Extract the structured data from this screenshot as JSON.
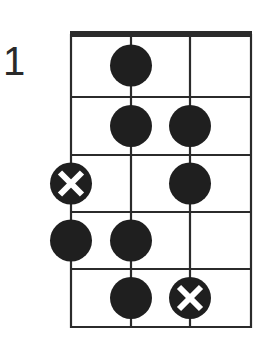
{
  "diagram": {
    "type": "fretboard-chord-diagram",
    "starting_fret_label": "1",
    "strings": 4,
    "frets_shown": 5,
    "colors": {
      "line": "#2b2b2b",
      "dot": "#1f1f1f",
      "x_mark": "#ffffff",
      "background": "#ffffff"
    },
    "markers": [
      {
        "fret": 1,
        "string": 2,
        "kind": "dot"
      },
      {
        "fret": 2,
        "string": 2,
        "kind": "dot"
      },
      {
        "fret": 2,
        "string": 3,
        "kind": "dot"
      },
      {
        "fret": 3,
        "string": 1,
        "kind": "x"
      },
      {
        "fret": 3,
        "string": 3,
        "kind": "dot"
      },
      {
        "fret": 4,
        "string": 1,
        "kind": "dot"
      },
      {
        "fret": 4,
        "string": 2,
        "kind": "dot"
      },
      {
        "fret": 5,
        "string": 2,
        "kind": "dot"
      },
      {
        "fret": 5,
        "string": 3,
        "kind": "x"
      }
    ]
  }
}
